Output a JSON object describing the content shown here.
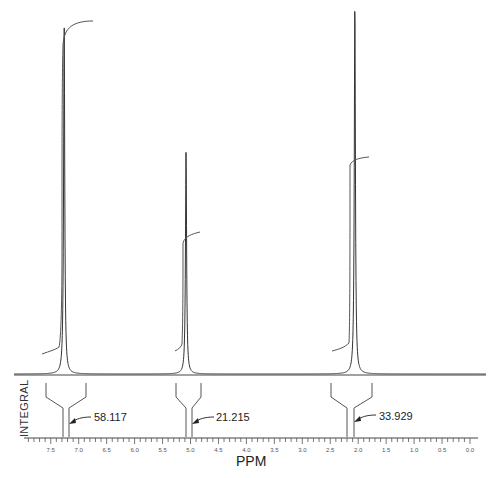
{
  "chart_data": {
    "type": "line",
    "title": "",
    "xlabel": "PPM",
    "ylabel": "INTEGRAL",
    "xlim": [
      7.85,
      0.0
    ],
    "x_reversed": true,
    "grid": false,
    "x_ticks": [
      "7.5",
      "7.0",
      "6.5",
      "6.0",
      "5.5",
      "5.0",
      "4.5",
      "4.0",
      "3.5",
      "3.0",
      "2.5",
      "2.0",
      "1.5",
      "1.0",
      "0.5",
      "0.0"
    ],
    "peaks": [
      {
        "ppm": 7.26,
        "relative_height": 0.95,
        "integral": "58.117"
      },
      {
        "ppm": 5.08,
        "relative_height": 0.6,
        "integral": "21.215"
      },
      {
        "ppm": 2.06,
        "relative_height": 1.0,
        "integral": "33.929"
      }
    ],
    "integrals": [
      {
        "label": "58.117",
        "value": 58.117,
        "ppm_start": 7.35,
        "ppm_end": 7.17
      },
      {
        "label": "21.215",
        "value": 21.215,
        "ppm_start": 5.15,
        "ppm_end": 5.0
      },
      {
        "label": "33.929",
        "value": 33.929,
        "ppm_start": 2.12,
        "ppm_end": 1.98
      }
    ]
  },
  "labels": {
    "xlabel": "PPM",
    "side": "INTEGRAL",
    "integrals": [
      "58.117",
      "21.215",
      "33.929"
    ],
    "ticks": [
      "7.5",
      "7.0",
      "6.5",
      "6.0",
      "5.5",
      "5.0",
      "4.5",
      "4.0",
      "3.5",
      "3.0",
      "2.5",
      "2.0",
      "1.5",
      "1.0",
      "0.5",
      "0.0"
    ]
  },
  "colors": {
    "line": "#333333",
    "text": "#222222"
  }
}
